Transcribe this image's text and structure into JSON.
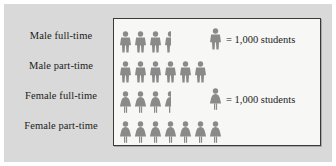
{
  "figure": {
    "panel_bg": "#f7f7f5",
    "plate_bg": "#d9d9d9",
    "border_color": "#3a3a3a",
    "figure_color": "#8a8a8a"
  },
  "row_labels": [
    {
      "label": "Male full-time"
    },
    {
      "label": "Male part-time"
    },
    {
      "label": "Female full-time"
    },
    {
      "label": "Female part-time"
    }
  ],
  "legends": [
    {
      "icon": "male-figure-icon",
      "text": "= 1,000 students"
    },
    {
      "icon": "female-figure-icon",
      "text": "= 1,000 students"
    }
  ],
  "chart_data": {
    "type": "bar",
    "subtype": "pictogram",
    "title": "",
    "xlabel": "",
    "ylabel": "",
    "unit_value": 1000,
    "unit_label": "students",
    "legend_position": "inside-right",
    "grid": false,
    "categories": [
      "Male full-time",
      "Male part-time",
      "Female full-time",
      "Female part-time"
    ],
    "icons": [
      3.5,
      6,
      3.5,
      7
    ],
    "values": [
      3500,
      6000,
      3500,
      7000
    ],
    "icon_types": [
      "male-figure-icon",
      "male-figure-icon",
      "female-figure-icon",
      "female-figure-icon"
    ],
    "rows": [
      {
        "category": "Male full-time",
        "full_icons": 3,
        "half_icons": 1,
        "icons": 3.5,
        "value": 3500,
        "icon_type": "male-figure-icon"
      },
      {
        "category": "Male part-time",
        "full_icons": 6,
        "half_icons": 0,
        "icons": 6,
        "value": 6000,
        "icon_type": "male-figure-icon"
      },
      {
        "category": "Female full-time",
        "full_icons": 3,
        "half_icons": 1,
        "icons": 3.5,
        "value": 3500,
        "icon_type": "female-figure-icon"
      },
      {
        "category": "Female part-time",
        "full_icons": 7,
        "half_icons": 0,
        "icons": 7,
        "value": 7000,
        "icon_type": "female-figure-icon"
      }
    ]
  }
}
